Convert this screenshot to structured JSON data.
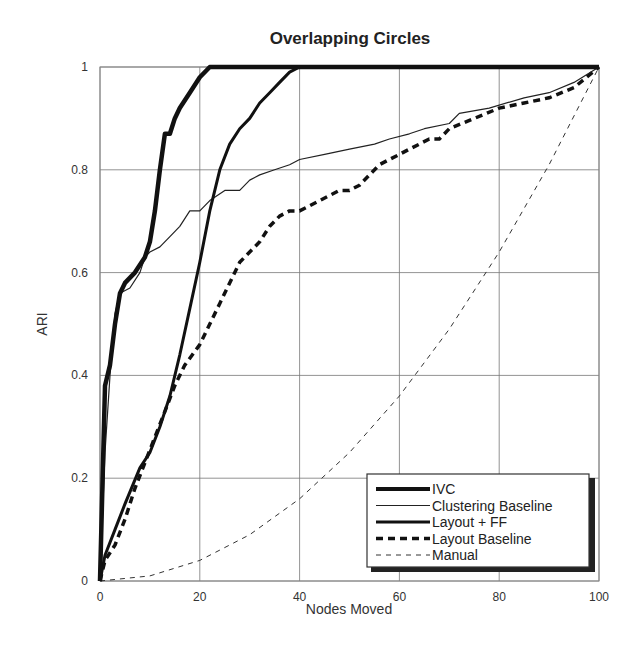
{
  "chart_data": {
    "type": "line",
    "title": "Overlapping Circles",
    "xlabel": "Nodes Moved",
    "ylabel": "ARI",
    "xlim": [
      0,
      100
    ],
    "ylim": [
      0,
      1
    ],
    "xticks": [
      0,
      20,
      40,
      60,
      80,
      100
    ],
    "yticks": [
      0,
      0.2,
      0.4,
      0.6,
      0.8,
      1
    ],
    "ytick_labels": [
      "0",
      "0.2",
      "0.4",
      "0.6",
      "0.8",
      "1"
    ],
    "grid": true,
    "legend_position": "lower right",
    "series": [
      {
        "name": "IVC",
        "style": "solid-thick",
        "x": [
          0,
          1,
          2,
          3,
          4,
          5,
          7,
          9,
          10,
          11,
          12,
          13,
          14,
          15,
          16,
          18,
          20,
          22,
          100
        ],
        "y": [
          0,
          0.38,
          0.42,
          0.5,
          0.56,
          0.58,
          0.6,
          0.63,
          0.66,
          0.72,
          0.8,
          0.87,
          0.87,
          0.9,
          0.92,
          0.95,
          0.98,
          1.0,
          1.0
        ]
      },
      {
        "name": "Clustering Baseline",
        "style": "solid-thin",
        "x": [
          0,
          1,
          2,
          3,
          4,
          6,
          8,
          9,
          10,
          12,
          14,
          16,
          18,
          20,
          22,
          25,
          28,
          30,
          32,
          35,
          38,
          40,
          45,
          50,
          55,
          58,
          62,
          65,
          70,
          72,
          78,
          85,
          90,
          95,
          100
        ],
        "y": [
          0,
          0.25,
          0.4,
          0.52,
          0.56,
          0.57,
          0.6,
          0.63,
          0.64,
          0.65,
          0.67,
          0.69,
          0.72,
          0.72,
          0.74,
          0.76,
          0.76,
          0.78,
          0.79,
          0.8,
          0.81,
          0.82,
          0.83,
          0.84,
          0.85,
          0.86,
          0.87,
          0.88,
          0.89,
          0.91,
          0.92,
          0.94,
          0.95,
          0.97,
          1.0
        ]
      },
      {
        "name": "Layout + FF",
        "style": "solid-medium",
        "x": [
          0,
          1,
          3,
          5,
          8,
          10,
          12,
          14,
          16,
          18,
          20,
          22,
          24,
          26,
          28,
          30,
          32,
          34,
          36,
          38,
          40,
          100
        ],
        "y": [
          0,
          0.05,
          0.1,
          0.15,
          0.22,
          0.25,
          0.3,
          0.36,
          0.44,
          0.53,
          0.62,
          0.72,
          0.8,
          0.85,
          0.88,
          0.9,
          0.93,
          0.95,
          0.97,
          0.99,
          1.0,
          1.0
        ]
      },
      {
        "name": "Layout Baseline",
        "style": "dashed-thick",
        "x": [
          0,
          1,
          3,
          5,
          7,
          9,
          11,
          13,
          15,
          17,
          20,
          22,
          24,
          26,
          28,
          30,
          32,
          34,
          36,
          38,
          40,
          42,
          44,
          46,
          48,
          50,
          52,
          54,
          56,
          58,
          60,
          62,
          64,
          66,
          68,
          70,
          75,
          80,
          85,
          90,
          95,
          100
        ],
        "y": [
          0,
          0.04,
          0.07,
          0.12,
          0.18,
          0.23,
          0.28,
          0.33,
          0.38,
          0.42,
          0.46,
          0.5,
          0.54,
          0.58,
          0.62,
          0.64,
          0.66,
          0.69,
          0.71,
          0.72,
          0.72,
          0.73,
          0.74,
          0.75,
          0.76,
          0.76,
          0.77,
          0.79,
          0.81,
          0.82,
          0.83,
          0.84,
          0.85,
          0.86,
          0.86,
          0.88,
          0.9,
          0.92,
          0.93,
          0.94,
          0.96,
          1.0
        ]
      },
      {
        "name": "Manual",
        "style": "dashed-thin",
        "x": [
          0,
          10,
          20,
          30,
          40,
          50,
          60,
          70,
          80,
          90,
          100
        ],
        "y": [
          0,
          0.01,
          0.04,
          0.09,
          0.16,
          0.25,
          0.36,
          0.49,
          0.64,
          0.81,
          1.0
        ]
      }
    ]
  },
  "legend": {
    "items": [
      "IVC",
      "Clustering Baseline",
      "Layout + FF",
      "Layout Baseline",
      "Manual"
    ]
  }
}
